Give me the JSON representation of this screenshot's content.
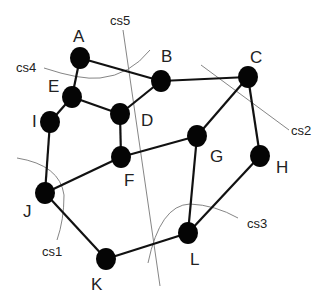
{
  "diagram": {
    "type": "graph",
    "colors": {
      "node": "#050505",
      "edge": "#111111",
      "cut_line": "#777777",
      "background": "#ffffff"
    },
    "nodes": [
      {
        "id": "A",
        "label": "A",
        "x": 80,
        "y": 58,
        "lx": 73,
        "ly": 42
      },
      {
        "id": "B",
        "label": "B",
        "x": 161,
        "y": 81,
        "lx": 161,
        "ly": 62
      },
      {
        "id": "C",
        "label": "C",
        "x": 248,
        "y": 77,
        "lx": 250,
        "ly": 63
      },
      {
        "id": "D",
        "label": "D",
        "x": 120,
        "y": 114,
        "lx": 141,
        "ly": 126
      },
      {
        "id": "E",
        "label": "E",
        "x": 72,
        "y": 97,
        "lx": 48,
        "ly": 92
      },
      {
        "id": "I",
        "label": "I",
        "x": 50,
        "y": 122,
        "lx": 32,
        "ly": 127
      },
      {
        "id": "F",
        "label": "F",
        "x": 121,
        "y": 157,
        "lx": 124,
        "ly": 186
      },
      {
        "id": "G",
        "label": "G",
        "x": 197,
        "y": 136,
        "lx": 210,
        "ly": 162
      },
      {
        "id": "H",
        "label": "H",
        "x": 260,
        "y": 156,
        "lx": 276,
        "ly": 173
      },
      {
        "id": "J",
        "label": "J",
        "x": 45,
        "y": 193,
        "lx": 23,
        "ly": 217
      },
      {
        "id": "K",
        "label": "K",
        "x": 106,
        "y": 259,
        "lx": 91,
        "ly": 290
      },
      {
        "id": "L",
        "label": "L",
        "x": 188,
        "y": 233,
        "lx": 190,
        "ly": 265
      }
    ],
    "edges": [
      [
        "A",
        "B"
      ],
      [
        "A",
        "E"
      ],
      [
        "E",
        "I"
      ],
      [
        "E",
        "D"
      ],
      [
        "D",
        "B"
      ],
      [
        "B",
        "C"
      ],
      [
        "D",
        "F"
      ],
      [
        "F",
        "G"
      ],
      [
        "F",
        "J"
      ],
      [
        "I",
        "J"
      ],
      [
        "G",
        "C"
      ],
      [
        "C",
        "H"
      ],
      [
        "G",
        "L"
      ],
      [
        "H",
        "L"
      ],
      [
        "J",
        "K"
      ],
      [
        "K",
        "L"
      ]
    ],
    "cuts": [
      {
        "id": "cs1",
        "label": "cs1",
        "path": "M17,158 Q60,165 64,195 Q64,220 57,240",
        "lx": 42,
        "ly": 256
      },
      {
        "id": "cs2",
        "label": "cs2",
        "path": "M201,65 L289,130",
        "lx": 291,
        "ly": 135
      },
      {
        "id": "cs3",
        "label": "cs3",
        "path": "M148,263 Q160,205 190,204 Q215,205 238,218",
        "lx": 247,
        "ly": 228
      },
      {
        "id": "cs4",
        "label": "cs4",
        "path": "M44,68 Q80,80 100,78 Q130,75 150,50",
        "lx": 16,
        "ly": 72
      },
      {
        "id": "cs5",
        "label": "cs5",
        "path": "M123,30 L160,286",
        "lx": 110,
        "ly": 25
      }
    ]
  }
}
